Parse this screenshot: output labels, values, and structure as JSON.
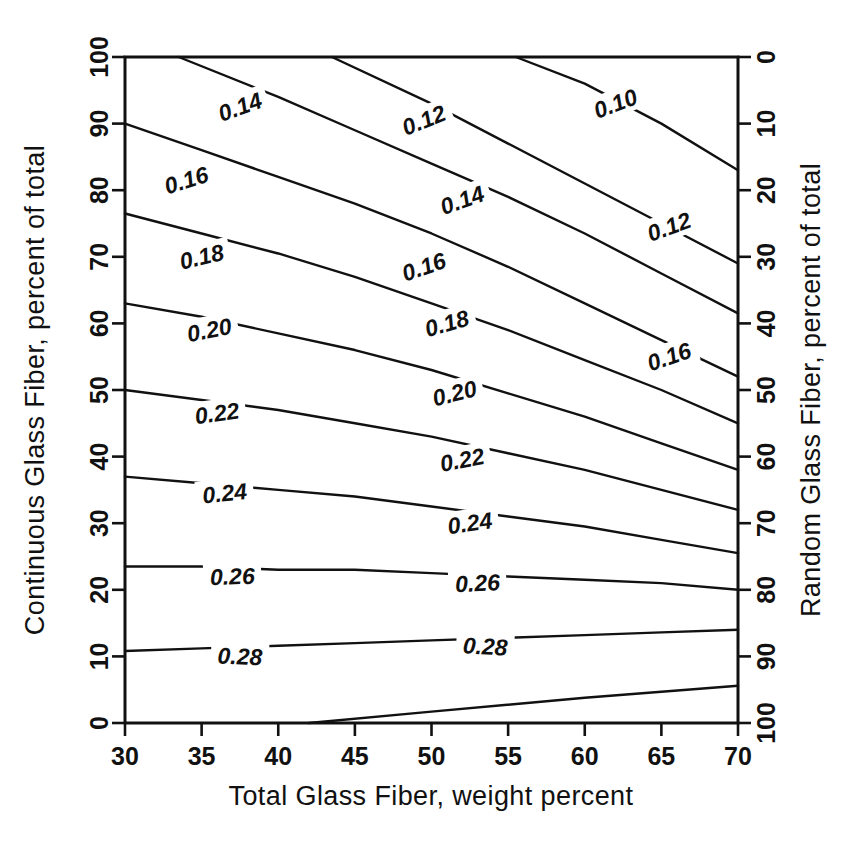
{
  "chart_data": {
    "type": "line",
    "title": "",
    "subtitle": "",
    "xlabel": "Total Glass Fiber, weight percent",
    "ylabel": "Continuous Glass Fiber, percent of total",
    "y2label": "Random Glass Fiber, percent of total",
    "xlim": [
      30,
      70
    ],
    "ylim": [
      0,
      100
    ],
    "y2lim": [
      100,
      0
    ],
    "grid": false,
    "legend": "none",
    "xticks": [
      30,
      35,
      40,
      45,
      50,
      55,
      60,
      65,
      70
    ],
    "yticks": [
      0,
      10,
      20,
      30,
      40,
      50,
      60,
      70,
      80,
      90,
      100
    ],
    "y2ticks": [
      0,
      10,
      20,
      30,
      40,
      50,
      60,
      70,
      80,
      90,
      100
    ],
    "xticklabels": [
      "30",
      "35",
      "40",
      "45",
      "50",
      "55",
      "60",
      "65",
      "70"
    ],
    "yticklabels": [
      "0",
      "10",
      "20",
      "30",
      "40",
      "50",
      "60",
      "70",
      "80",
      "90",
      "100"
    ],
    "y2ticklabels": [
      "0",
      "10",
      "20",
      "30",
      "40",
      "50",
      "60",
      "70",
      "80",
      "90",
      "100"
    ],
    "contour_levels": [
      0.1,
      0.12,
      0.14,
      0.16,
      0.18,
      0.2,
      0.22,
      0.24,
      0.26,
      0.28,
      0.3
    ],
    "series": [
      {
        "name": "0.10",
        "level": 0.1,
        "label": "0.10",
        "points": [
          [
            55.5,
            100
          ],
          [
            60,
            96
          ],
          [
            65,
            90
          ],
          [
            70,
            83
          ]
        ]
      },
      {
        "name": "0.12",
        "level": 0.12,
        "label": "0.12",
        "points": [
          [
            43.5,
            100
          ],
          [
            50,
            93
          ],
          [
            55,
            87
          ],
          [
            60,
            81
          ],
          [
            65,
            75
          ],
          [
            70,
            69
          ]
        ]
      },
      {
        "name": "0.14",
        "level": 0.14,
        "label": "0.14",
        "points": [
          [
            33.5,
            100
          ],
          [
            40,
            94
          ],
          [
            45,
            89
          ],
          [
            50,
            84
          ],
          [
            55,
            79
          ],
          [
            60,
            73.5
          ],
          [
            65,
            67.5
          ],
          [
            70,
            61.5
          ]
        ]
      },
      {
        "name": "0.16",
        "level": 0.16,
        "label": "0.16",
        "points": [
          [
            30,
            90
          ],
          [
            35,
            86
          ],
          [
            40,
            82
          ],
          [
            45,
            78
          ],
          [
            50,
            73.5
          ],
          [
            55,
            68.5
          ],
          [
            60,
            63
          ],
          [
            65,
            57.5
          ],
          [
            70,
            52
          ]
        ]
      },
      {
        "name": "0.18",
        "level": 0.18,
        "label": "0.18",
        "points": [
          [
            30,
            76.5
          ],
          [
            35,
            73.5
          ],
          [
            40,
            70.5
          ],
          [
            45,
            67
          ],
          [
            50,
            63
          ],
          [
            55,
            59
          ],
          [
            60,
            54.5
          ],
          [
            65,
            50
          ],
          [
            70,
            45
          ]
        ]
      },
      {
        "name": "0.20",
        "level": 0.2,
        "label": "0.20",
        "points": [
          [
            30,
            63
          ],
          [
            35,
            61
          ],
          [
            40,
            58.5
          ],
          [
            45,
            56
          ],
          [
            50,
            53
          ],
          [
            55,
            49.5
          ],
          [
            60,
            46
          ],
          [
            65,
            42
          ],
          [
            70,
            38
          ]
        ]
      },
      {
        "name": "0.22",
        "level": 0.22,
        "label": "0.22",
        "points": [
          [
            30,
            50
          ],
          [
            35,
            48.5
          ],
          [
            40,
            47
          ],
          [
            45,
            45
          ],
          [
            50,
            43
          ],
          [
            55,
            40.5
          ],
          [
            60,
            38
          ],
          [
            65,
            35
          ],
          [
            70,
            32
          ]
        ]
      },
      {
        "name": "0.24",
        "level": 0.24,
        "label": "0.24",
        "points": [
          [
            30,
            37
          ],
          [
            35,
            36
          ],
          [
            40,
            35
          ],
          [
            45,
            34
          ],
          [
            50,
            32.5
          ],
          [
            55,
            31
          ],
          [
            60,
            29.5
          ],
          [
            65,
            27.5
          ],
          [
            70,
            25.5
          ]
        ]
      },
      {
        "name": "0.26",
        "level": 0.26,
        "label": "0.26",
        "points": [
          [
            30,
            23.5
          ],
          [
            35,
            23.5
          ],
          [
            40,
            23
          ],
          [
            45,
            23
          ],
          [
            50,
            22.5
          ],
          [
            55,
            22
          ],
          [
            60,
            21.5
          ],
          [
            65,
            21
          ],
          [
            70,
            20
          ]
        ]
      },
      {
        "name": "0.28",
        "level": 0.28,
        "label": "0.28",
        "points": [
          [
            30,
            10.8
          ],
          [
            35,
            11.2
          ],
          [
            40,
            11.6
          ],
          [
            45,
            12
          ],
          [
            50,
            12.4
          ],
          [
            55,
            12.8
          ],
          [
            60,
            13.2
          ],
          [
            65,
            13.6
          ],
          [
            70,
            14
          ]
        ]
      },
      {
        "name": "0.30",
        "level": 0.3,
        "label": "",
        "points": [
          [
            42,
            0
          ],
          [
            50,
            1.7
          ],
          [
            60,
            3.8
          ],
          [
            70,
            5.6
          ]
        ]
      }
    ],
    "contour_label_positions": [
      {
        "text": "0.10",
        "x": 62.0,
        "y": 93.0,
        "rotate": -21
      },
      {
        "text": "0.12",
        "x": 49.5,
        "y": 90.5,
        "rotate": -22
      },
      {
        "text": "0.12",
        "x": 65.5,
        "y": 74.5,
        "rotate": -20
      },
      {
        "text": "0.14",
        "x": 37.5,
        "y": 92.5,
        "rotate": -20
      },
      {
        "text": "0.14",
        "x": 52.0,
        "y": 78.5,
        "rotate": -20
      },
      {
        "text": "0.16",
        "x": 34.0,
        "y": 81.5,
        "rotate": -17
      },
      {
        "text": "0.16",
        "x": 49.5,
        "y": 68.5,
        "rotate": -19
      },
      {
        "text": "0.16",
        "x": 65.5,
        "y": 55.0,
        "rotate": -19
      },
      {
        "text": "0.18",
        "x": 35.0,
        "y": 70.0,
        "rotate": -13
      },
      {
        "text": "0.18",
        "x": 51.0,
        "y": 60.0,
        "rotate": -16
      },
      {
        "text": "0.20",
        "x": 35.5,
        "y": 59.0,
        "rotate": -11
      },
      {
        "text": "0.20",
        "x": 51.5,
        "y": 49.5,
        "rotate": -14
      },
      {
        "text": "0.22",
        "x": 36.0,
        "y": 46.5,
        "rotate": -8
      },
      {
        "text": "0.22",
        "x": 52.0,
        "y": 39.5,
        "rotate": -11
      },
      {
        "text": "0.24",
        "x": 36.5,
        "y": 34.5,
        "rotate": -6
      },
      {
        "text": "0.24",
        "x": 52.5,
        "y": 30.0,
        "rotate": -8
      },
      {
        "text": "0.26",
        "x": 37.0,
        "y": 22.0,
        "rotate": -2
      },
      {
        "text": "0.26",
        "x": 53.0,
        "y": 21.0,
        "rotate": -3
      },
      {
        "text": "0.28",
        "x": 37.5,
        "y": 10.0,
        "rotate": 2
      },
      {
        "text": "0.28",
        "x": 53.5,
        "y": 11.5,
        "rotate": 3
      }
    ]
  },
  "figure": {
    "page_number": "",
    "caption": ""
  }
}
